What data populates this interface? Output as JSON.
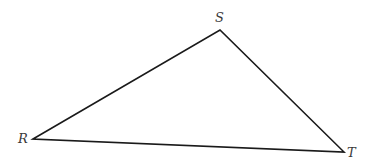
{
  "diagram": {
    "type": "triangle",
    "stroke_color": "#1a1a1a",
    "label_color": "#3a3a3a",
    "vertices": [
      {
        "name": "R",
        "x": 33,
        "y": 139,
        "label_x": 18,
        "label_y": 143
      },
      {
        "name": "S",
        "x": 220,
        "y": 30,
        "label_x": 215,
        "label_y": 22
      },
      {
        "name": "T",
        "x": 344,
        "y": 152,
        "label_x": 347,
        "label_y": 157
      }
    ]
  }
}
